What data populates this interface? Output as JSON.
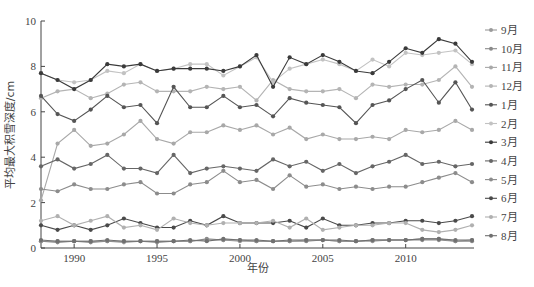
{
  "chart_data": {
    "type": "line",
    "title": "",
    "xlabel": "年份",
    "ylabel": "平均最大积雪深度/cm",
    "xlim": [
      1988,
      2014
    ],
    "ylim": [
      0,
      10
    ],
    "yticks": [
      0,
      2,
      4,
      6,
      8,
      10
    ],
    "xticks": [
      1990,
      1995,
      2000,
      2005,
      2010
    ],
    "grid": false,
    "legend_position": "right",
    "x": [
      1988,
      1989,
      1990,
      1991,
      1992,
      1993,
      1994,
      1995,
      1996,
      1997,
      1998,
      1999,
      2000,
      2001,
      2002,
      2003,
      2004,
      2005,
      2006,
      2007,
      2008,
      2009,
      2010,
      2011,
      2012,
      2013,
      2014
    ],
    "series": [
      {
        "name": "9月",
        "color": "#9a9a9a",
        "values": [
          0.3,
          0.3,
          0.3,
          0.3,
          0.3,
          0.25,
          0.3,
          0.3,
          0.3,
          0.3,
          0.35,
          0.35,
          0.3,
          0.3,
          0.3,
          0.3,
          0.35,
          0.35,
          0.3,
          0.3,
          0.3,
          0.35,
          0.35,
          0.4,
          0.4,
          0.3,
          0.35
        ]
      },
      {
        "name": "10月",
        "color": "#8a8a8a",
        "values": [
          0.3,
          0.25,
          0.3,
          0.25,
          0.3,
          0.3,
          0.3,
          0.25,
          0.3,
          0.3,
          0.4,
          0.35,
          0.35,
          0.3,
          0.3,
          0.3,
          0.3,
          0.35,
          0.3,
          0.3,
          0.35,
          0.35,
          0.35,
          0.35,
          0.35,
          0.3,
          0.3
        ]
      },
      {
        "name": "11月",
        "color": "#a8a8a8",
        "values": [
          2.1,
          4.6,
          5.2,
          4.5,
          4.6,
          5.0,
          5.6,
          4.8,
          4.6,
          5.1,
          5.1,
          5.4,
          5.2,
          5.4,
          5.0,
          5.3,
          4.8,
          5.0,
          4.8,
          4.8,
          4.9,
          4.8,
          5.2,
          5.1,
          5.2,
          5.6,
          5.2
        ]
      },
      {
        "name": "12月",
        "color": "#b4b4b4",
        "values": [
          6.6,
          6.9,
          7.0,
          6.6,
          6.8,
          7.2,
          7.3,
          6.9,
          6.9,
          6.9,
          7.1,
          7.0,
          7.1,
          6.5,
          7.4,
          7.0,
          6.9,
          6.9,
          7.0,
          6.6,
          7.2,
          7.1,
          7.2,
          7.2,
          7.4,
          8.0,
          7.1
        ]
      },
      {
        "name": "1月",
        "color": "#555555",
        "values": [
          6.7,
          5.9,
          5.6,
          6.1,
          6.7,
          6.2,
          6.3,
          5.5,
          7.1,
          6.2,
          6.2,
          6.7,
          6.2,
          6.3,
          5.8,
          6.6,
          6.4,
          6.3,
          6.2,
          5.5,
          6.3,
          6.5,
          7.0,
          7.4,
          6.4,
          7.3,
          6.1
        ]
      },
      {
        "name": "2月",
        "color": "#c2c2c2",
        "values": [
          7.7,
          7.4,
          7.3,
          7.4,
          7.8,
          7.7,
          8.1,
          7.8,
          7.9,
          8.1,
          8.1,
          7.6,
          8.0,
          8.4,
          7.3,
          7.9,
          8.1,
          8.3,
          8.1,
          7.8,
          8.3,
          8.0,
          8.6,
          8.5,
          8.6,
          8.7,
          8.1
        ]
      },
      {
        "name": "3月",
        "color": "#3a3a3a",
        "values": [
          7.7,
          7.4,
          7.0,
          7.4,
          8.1,
          8.0,
          8.1,
          7.8,
          7.9,
          7.9,
          7.9,
          7.8,
          8.0,
          8.5,
          7.1,
          8.4,
          8.1,
          8.5,
          8.2,
          7.8,
          7.7,
          8.2,
          8.8,
          8.6,
          9.2,
          9.0,
          8.2
        ]
      },
      {
        "name": "4月",
        "color": "#666666",
        "values": [
          3.6,
          3.9,
          3.5,
          3.7,
          4.1,
          3.5,
          3.5,
          3.3,
          4.1,
          3.3,
          3.5,
          3.6,
          3.5,
          3.4,
          3.9,
          3.6,
          3.8,
          3.4,
          3.7,
          3.3,
          3.6,
          3.8,
          4.1,
          3.7,
          3.8,
          3.6,
          3.7
        ]
      },
      {
        "name": "5月",
        "color": "#8c8c8c",
        "values": [
          2.6,
          2.5,
          2.8,
          2.6,
          2.6,
          2.8,
          2.9,
          2.4,
          2.4,
          2.8,
          2.9,
          3.4,
          2.9,
          3.0,
          2.6,
          3.2,
          2.7,
          2.8,
          2.6,
          2.7,
          2.6,
          2.7,
          2.7,
          2.9,
          3.1,
          3.3,
          2.9
        ]
      },
      {
        "name": "6月",
        "color": "#4a4a4a",
        "values": [
          1.0,
          0.8,
          1.0,
          0.8,
          1.0,
          1.3,
          1.1,
          0.9,
          0.9,
          1.2,
          1.0,
          1.4,
          1.1,
          1.1,
          1.1,
          1.2,
          0.9,
          1.3,
          1.0,
          1.0,
          1.1,
          1.1,
          1.2,
          1.2,
          1.1,
          1.2,
          1.4
        ]
      },
      {
        "name": "7月",
        "color": "#b0b0b0",
        "values": [
          1.2,
          1.4,
          1.0,
          1.2,
          1.4,
          0.9,
          1.0,
          0.8,
          1.3,
          1.1,
          1.0,
          1.1,
          1.1,
          1.1,
          1.2,
          0.9,
          1.3,
          0.8,
          0.9,
          1.0,
          1.0,
          1.1,
          1.1,
          0.8,
          0.7,
          0.8,
          1.0
        ]
      },
      {
        "name": "8月",
        "color": "#707070",
        "values": [
          0.35,
          0.3,
          0.3,
          0.3,
          0.35,
          0.3,
          0.3,
          0.3,
          0.3,
          0.35,
          0.3,
          0.4,
          0.35,
          0.35,
          0.3,
          0.35,
          0.35,
          0.35,
          0.35,
          0.3,
          0.35,
          0.35,
          0.35,
          0.4,
          0.4,
          0.35,
          0.35
        ]
      }
    ]
  }
}
